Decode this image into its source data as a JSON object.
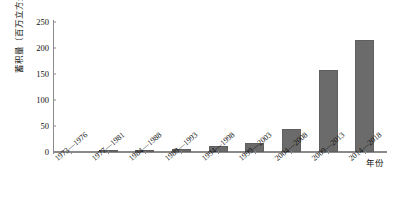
{
  "chart_data": {
    "type": "bar",
    "title": "",
    "xlabel": "年份",
    "ylabel": "蓄积量（百万立方米）",
    "categories": [
      "1973—1976",
      "1977—1981",
      "1984—1988",
      "1989—1993",
      "1994—1998",
      "1999—2003",
      "2004—2008",
      "2009—2013",
      "2014—2018"
    ],
    "values": [
      0,
      4,
      3,
      6,
      12,
      17,
      44,
      158,
      215
    ],
    "ylim": [
      0,
      250
    ],
    "yticks": [
      0,
      50,
      100,
      150,
      200,
      250
    ],
    "grid": false,
    "legend": false,
    "bar_color": "#6b6b6b",
    "axis_color": "#8a8a8a"
  }
}
